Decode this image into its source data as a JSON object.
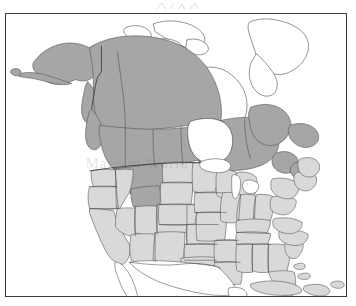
{
  "figure": {
    "type": "range-map",
    "region": "North America",
    "frame": {
      "border_color": "#3a3a3a",
      "background": "#ffffff"
    },
    "watermark_text": "Maps of World"
  },
  "legend": {
    "classes": [
      {
        "name": "range-core",
        "color": "#a6a6a6",
        "label": "Shaded dark gray"
      },
      {
        "name": "range-secondary",
        "color": "#d9d9d9",
        "label": "Shaded light gray"
      },
      {
        "name": "outside-range",
        "color": "#ffffff",
        "label": "Unshaded"
      }
    ]
  },
  "map_data": {
    "type": "choropleth",
    "title": "",
    "areas_dark_gray": [
      "Alaska",
      "Yukon",
      "British Columbia",
      "Northwest Territories",
      "Alberta",
      "Saskatchewan",
      "Manitoba",
      "Ontario",
      "Quebec",
      "Labrador",
      "Newfoundland",
      "New Brunswick",
      "Nova Scotia",
      "Prince Edward Island",
      "Montana",
      "Wyoming",
      "Aleutian Islands"
    ],
    "areas_light_gray": [
      "Washington",
      "Oregon",
      "California",
      "Idaho",
      "Nevada",
      "Utah",
      "Arizona",
      "Colorado",
      "New Mexico",
      "North Dakota",
      "South Dakota",
      "Nebraska",
      "Kansas",
      "Oklahoma",
      "Texas",
      "Minnesota",
      "Iowa",
      "Missouri",
      "Arkansas",
      "Louisiana",
      "Wisconsin",
      "Illinois",
      "Michigan",
      "Indiana",
      "Ohio",
      "Kentucky",
      "Tennessee",
      "Mississippi",
      "Alabama",
      "Georgia",
      "Florida",
      "South Carolina",
      "North Carolina",
      "Virginia",
      "West Virginia",
      "Maryland",
      "Delaware",
      "Pennsylvania",
      "New Jersey",
      "New York",
      "Connecticut",
      "Rhode Island",
      "Massachusetts",
      "Vermont",
      "New Hampshire",
      "Maine",
      "Cuba",
      "Hispaniola",
      "Bahamas",
      "Puerto Rico"
    ],
    "areas_unshaded": [
      "Greenland",
      "Canadian Arctic Archipelago",
      "Baffin Island",
      "Victoria Island",
      "Banks Island",
      "Ellesmere Island",
      "Mexico",
      "Great Lakes",
      "Hudson Bay"
    ]
  }
}
